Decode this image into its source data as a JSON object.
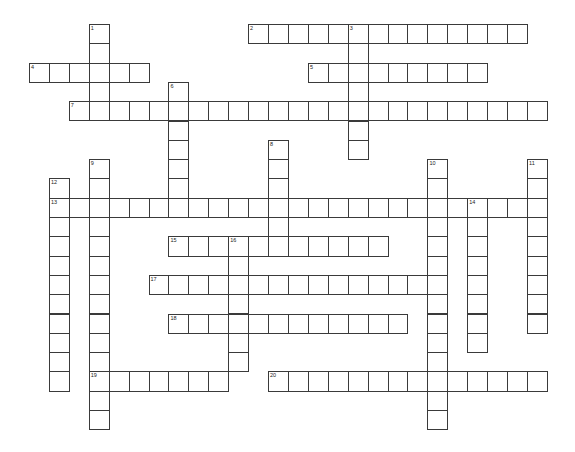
{
  "puzzle": {
    "grid": {
      "origin_x": 29,
      "origin_y": 24,
      "cell_w": 19.92,
      "cell_h": 19.3
    },
    "across": [
      {
        "number": 2,
        "row": 0,
        "col": 11,
        "length": 14
      },
      {
        "number": 4,
        "row": 2,
        "col": 0,
        "length": 6
      },
      {
        "number": 5,
        "row": 2,
        "col": 14,
        "length": 9
      },
      {
        "number": 7,
        "row": 4,
        "col": 2,
        "length": 24
      },
      {
        "number": 13,
        "row": 9,
        "col": 1,
        "length": 25
      },
      {
        "number": 15,
        "row": 11,
        "col": 7,
        "length": 11
      },
      {
        "number": 17,
        "row": 13,
        "col": 6,
        "length": 15
      },
      {
        "number": 18,
        "row": 15,
        "col": 7,
        "length": 12
      },
      {
        "number": 19,
        "row": 18,
        "col": 3,
        "length": 7
      },
      {
        "number": 20,
        "row": 18,
        "col": 12,
        "length": 14
      }
    ],
    "down": [
      {
        "number": 1,
        "row": 0,
        "col": 3,
        "length": 5
      },
      {
        "number": 3,
        "row": 0,
        "col": 16,
        "length": 7
      },
      {
        "number": 6,
        "row": 3,
        "col": 7,
        "length": 7
      },
      {
        "number": 8,
        "row": 6,
        "col": 12,
        "length": 6
      },
      {
        "number": 9,
        "row": 7,
        "col": 3,
        "length": 14
      },
      {
        "number": 10,
        "row": 7,
        "col": 20,
        "length": 14
      },
      {
        "number": 11,
        "row": 7,
        "col": 25,
        "length": 9
      },
      {
        "number": 12,
        "row": 8,
        "col": 1,
        "length": 11
      },
      {
        "number": 14,
        "row": 9,
        "col": 22,
        "length": 8
      },
      {
        "number": 16,
        "row": 11,
        "col": 10,
        "length": 7
      }
    ]
  }
}
